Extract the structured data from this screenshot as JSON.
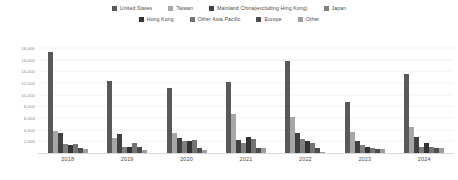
{
  "chart_data": {
    "type": "bar",
    "title": "",
    "subtitle": "",
    "xlabel": "",
    "ylabel": "",
    "categories": [
      "2018",
      "2019",
      "2020",
      "2021",
      "2022",
      "2023",
      "2024"
    ],
    "ylim": [
      0,
      18000
    ],
    "yticks": [
      2000,
      4000,
      6000,
      8000,
      10000,
      12000,
      14000,
      16000,
      18000
    ],
    "ytick_labels": [
      "2,000",
      "4,000",
      "6,000",
      "8,000",
      "10,000",
      "12,000",
      "14,000",
      "16,000",
      "18,000"
    ],
    "grid": true,
    "legend_position": "top",
    "orientation": "vertical",
    "series": [
      {
        "name": "United States",
        "color": "#595959",
        "values": [
          17400,
          12400,
          11200,
          12100,
          15800,
          8700,
          13500
        ]
      },
      {
        "name": "Taiwan",
        "color": "#a6a6a6",
        "values": [
          3700,
          2500,
          3400,
          6700,
          6100,
          3600,
          4500
        ]
      },
      {
        "name": "Mainland China(excluding Hing Kong)",
        "color": "#404040",
        "values": [
          3500,
          3300,
          2500,
          2200,
          3500,
          2000,
          2700
        ]
      },
      {
        "name": "Japan",
        "color": "#7f7f7f",
        "values": [
          1500,
          1100,
          2000,
          1800,
          2400,
          1300,
          1000
        ]
      },
      {
        "name": "Hong Kong",
        "color": "#333333",
        "values": [
          1400,
          1000,
          2100,
          2700,
          2100,
          1000,
          1700
        ]
      },
      {
        "name": "Other Asia Pacific",
        "color": "#737373",
        "values": [
          1500,
          1700,
          2200,
          2400,
          1700,
          800,
          1000
        ]
      },
      {
        "name": "Europe",
        "color": "#4d4d4d",
        "values": [
          800,
          1100,
          900,
          900,
          800,
          700,
          900
        ]
      },
      {
        "name": "Other",
        "color": "#9e9e9e",
        "values": [
          700,
          600,
          500,
          900,
          200,
          700,
          900
        ]
      }
    ]
  }
}
